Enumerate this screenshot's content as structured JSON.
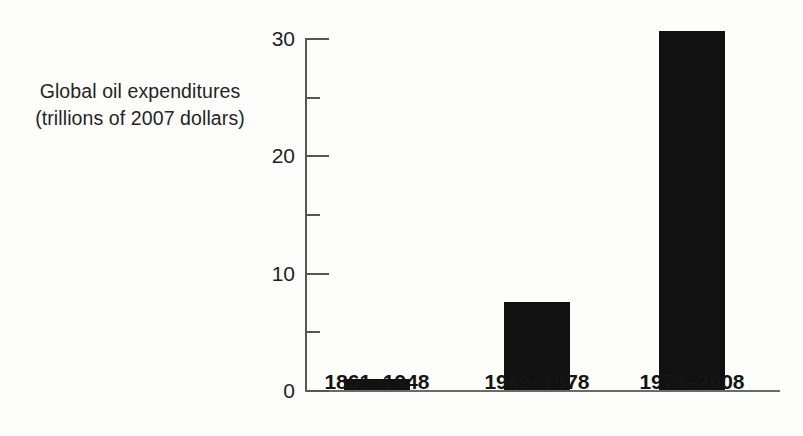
{
  "figure": {
    "y_axis_caption_line1": "Global oil expenditures",
    "y_axis_caption_line2": "(trillions of 2007 dollars)"
  },
  "chart_data": {
    "type": "bar",
    "title": "",
    "subtitle": "",
    "xlabel": "",
    "ylabel": "Global oil expenditures (trillions of 2007 dollars)",
    "categories": [
      "1861–1948",
      "1949–1978",
      "1979–2008"
    ],
    "values": [
      0.9,
      7.5,
      30.6
    ],
    "series": [
      {
        "name": "Global oil expenditures",
        "values": [
          0.9,
          7.5,
          30.6
        ]
      }
    ],
    "ylim": [
      0,
      31.5
    ],
    "y_major_ticks": [
      0,
      10,
      20,
      30
    ],
    "y_major_tick_labels": [
      "0",
      "10",
      "20",
      "30"
    ],
    "y_minor_ticks": [
      5,
      15,
      25
    ],
    "grid": false,
    "legend": false,
    "legend_position": "none",
    "bar_color": "#111111",
    "axis_color": "#555555",
    "text_color": "#1a1a1a",
    "background_color": "#fdfdfb",
    "tick_direction": "in",
    "annotations": []
  }
}
